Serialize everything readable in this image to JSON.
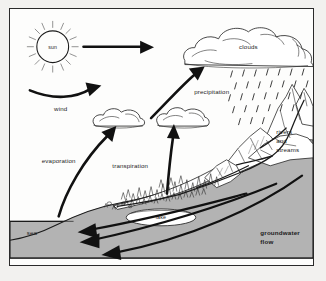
{
  "diagram": {
    "labels": {
      "sun": "sun",
      "wind": "wind",
      "evaporation": "evaporation",
      "transpiration": "transpiration",
      "clouds": "clouds",
      "precipitation": "precipitation",
      "rivers_line1": "rivers",
      "rivers_line2": "and",
      "rivers_line3": "streams",
      "lake": "lake",
      "sea": "sea",
      "groundwater_line1": "groundwater",
      "groundwater_line2": "flow"
    },
    "colors": {
      "ink": "#1b1b1b",
      "ground_fill": "#b3b3b3",
      "panel_background": "#fdfdfc",
      "page_background": "#f2f1ef",
      "border": "#2a2a2a"
    },
    "elements": {
      "sun_icon": "sun-icon",
      "cloud_large": "cloud-large",
      "cloud_small_left": "cloud-small-left",
      "cloud_small_right": "cloud-small-right",
      "rain_icon": "rain-icon",
      "mountain": "mountain-range",
      "forest": "forest",
      "lake_body": "lake-body",
      "sea_body": "sea-body"
    },
    "arrows": [
      {
        "name": "sun-to-clouds-arrow",
        "direction": "right"
      },
      {
        "name": "wind-arrow",
        "direction": "right"
      },
      {
        "name": "evaporation-arrow",
        "direction": "up-right"
      },
      {
        "name": "transpiration-arrow",
        "direction": "up"
      },
      {
        "name": "cloud-rise-arrow",
        "direction": "up-right"
      },
      {
        "name": "groundwater-arrow-1",
        "direction": "left"
      },
      {
        "name": "groundwater-arrow-2",
        "direction": "left"
      },
      {
        "name": "groundwater-arrow-3",
        "direction": "left"
      }
    ]
  }
}
